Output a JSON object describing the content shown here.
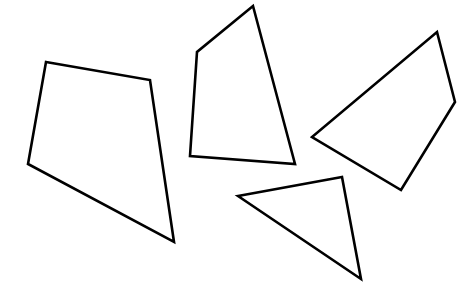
{
  "canvas": {
    "width": 474,
    "height": 301,
    "background": "#ffffff",
    "stroke_color": "#000000"
  },
  "shapes": [
    {
      "name": "quadrilateral-left",
      "type": "quadrilateral",
      "points": [
        [
          46,
          62
        ],
        [
          150,
          80
        ],
        [
          174,
          242
        ],
        [
          28,
          164
        ]
      ]
    },
    {
      "name": "quadrilateral-center",
      "type": "quadrilateral",
      "points": [
        [
          253,
          6
        ],
        [
          295,
          164
        ],
        [
          190,
          156
        ],
        [
          197,
          52
        ]
      ]
    },
    {
      "name": "quadrilateral-right",
      "type": "quadrilateral",
      "points": [
        [
          437,
          32
        ],
        [
          455,
          102
        ],
        [
          401,
          190
        ],
        [
          312,
          137
        ]
      ]
    },
    {
      "name": "triangle-bottom",
      "type": "triangle",
      "points": [
        [
          238,
          196
        ],
        [
          342,
          177
        ],
        [
          361,
          279
        ]
      ]
    }
  ]
}
